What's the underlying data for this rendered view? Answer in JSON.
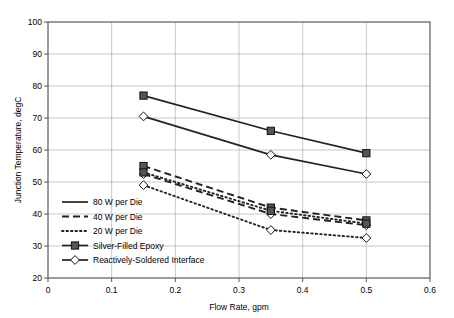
{
  "chart_data": {
    "type": "line",
    "title": "",
    "xlabel": "Flow Rate, gpm",
    "ylabel": "Junction Temperature, degC",
    "xlim": [
      0,
      0.6
    ],
    "ylim": [
      20,
      100
    ],
    "xticks": [
      "0",
      "0.1",
      "0.2",
      "0.3",
      "0.4",
      "0.5",
      "0.6"
    ],
    "xtick_values": [
      0,
      0.1,
      0.2,
      0.3,
      0.4,
      0.5,
      0.6
    ],
    "yticks": [
      "20",
      "30",
      "40",
      "50",
      "60",
      "70",
      "80",
      "90",
      "100"
    ],
    "ytick_values": [
      20,
      30,
      40,
      50,
      60,
      70,
      80,
      90,
      100
    ],
    "grid": true,
    "legend_position": "lower-left-inside",
    "x": [
      0.15,
      0.35,
      0.5
    ],
    "series": [
      {
        "name": "80 W per Die, Silver-Filled Epoxy",
        "power": "80 W per Die",
        "interface": "Silver-Filled Epoxy",
        "linestyle": "solid",
        "marker": "filled-square",
        "values": [
          77,
          66,
          59
        ]
      },
      {
        "name": "80 W per Die, Reactively-Soldered Interface",
        "power": "80 W per Die",
        "interface": "Reactively-Soldered Interface",
        "linestyle": "solid",
        "marker": "open-diamond",
        "values": [
          70.5,
          58.5,
          52.5
        ]
      },
      {
        "name": "40 W per Die, Silver-Filled Epoxy",
        "power": "40 W per Die",
        "interface": "Silver-Filled Epoxy",
        "linestyle": "dashed",
        "marker": "filled-square",
        "values": [
          55,
          42,
          38
        ]
      },
      {
        "name": "40 W per Die, Reactively-Soldered Interface",
        "power": "40 W per Die",
        "interface": "Reactively-Soldered Interface",
        "linestyle": "dashed",
        "marker": "open-diamond",
        "values": [
          52.5,
          40,
          36.5
        ]
      },
      {
        "name": "20 W per Die, Silver-Filled Epoxy",
        "power": "20 W per Die",
        "interface": "Silver-Filled Epoxy",
        "linestyle": "dotted",
        "marker": "filled-square",
        "values": [
          53,
          41,
          37
        ]
      },
      {
        "name": "20 W per Die, Reactively-Soldered Interface",
        "power": "20 W per Die",
        "interface": "Reactively-Soldered Interface",
        "linestyle": "dotted",
        "marker": "open-diamond",
        "values": [
          49,
          35,
          32.5
        ]
      }
    ],
    "legend": [
      {
        "label": "80 W per Die",
        "kind": "line",
        "linestyle": "solid",
        "marker": "none"
      },
      {
        "label": "40 W per Die",
        "kind": "line",
        "linestyle": "dashed",
        "marker": "none"
      },
      {
        "label": "20 W per Die",
        "kind": "line",
        "linestyle": "dotted",
        "marker": "none"
      },
      {
        "label": "Silver-Filled Epoxy",
        "kind": "marker",
        "linestyle": "solid",
        "marker": "filled-square"
      },
      {
        "label": "Reactively-Soldered Interface",
        "kind": "marker",
        "linestyle": "solid",
        "marker": "open-diamond"
      }
    ],
    "colors": {
      "line": "#222222",
      "grid": "#b0b0b0",
      "axis": "#555555",
      "marker_fill": "#555555",
      "background": "#ffffff"
    }
  }
}
